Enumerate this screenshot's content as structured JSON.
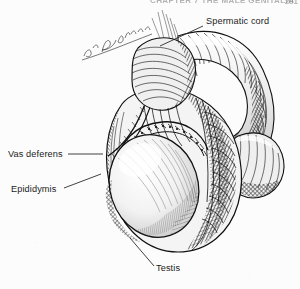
{
  "page": {
    "background_color": "#fcfcfc",
    "ink_color": "#1c1c1c",
    "header_text": "CHAPTER 7   THE MALE GENITALIA",
    "page_number": "201"
  },
  "figure": {
    "kind": "anatomical-line-engraving",
    "style": "pen-and-ink cross-hatched engraving",
    "signature": "F.J. Bandell",
    "parts": [
      "spermatic-cord",
      "vas-deferens",
      "epididymis",
      "testis",
      "scrotal-sac",
      "penis-shaft",
      "glans"
    ]
  },
  "labels": [
    {
      "id": "spermatic-cord",
      "text": "Spermatic cord",
      "x": 206,
      "y": 22,
      "leader": "M203,26 L160,46"
    },
    {
      "id": "vas-deferens",
      "text": "Vas deferens",
      "x": 8,
      "y": 155,
      "leader": "M68,154 L103,154"
    },
    {
      "id": "epididymis",
      "text": "Epididymis",
      "x": 11,
      "y": 190,
      "leader": "M64,188 L101,174"
    },
    {
      "id": "testis",
      "text": "Testis",
      "x": 156,
      "y": 269,
      "leader": "M154,266 L130,238"
    }
  ]
}
